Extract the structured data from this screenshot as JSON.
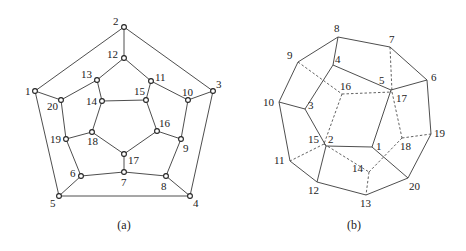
{
  "figures": [
    {
      "id": "a",
      "caption": "(a)",
      "caption_pos": [
        124,
        229
      ],
      "show_nodes": true,
      "nodes": {
        "1": {
          "x": 35,
          "y": 91,
          "lx": -10,
          "ly": 4
        },
        "2": {
          "x": 124,
          "y": 27,
          "lx": -11,
          "ly": -2
        },
        "3": {
          "x": 213,
          "y": 91,
          "lx": 3,
          "ly": -3
        },
        "4": {
          "x": 190,
          "y": 196,
          "lx": 3,
          "ly": 11
        },
        "5": {
          "x": 59,
          "y": 196,
          "lx": -9,
          "ly": 11
        },
        "6": {
          "x": 81,
          "y": 176,
          "lx": -11,
          "ly": 1
        },
        "7": {
          "x": 124,
          "y": 172,
          "lx": -3,
          "ly": 14
        },
        "8": {
          "x": 166,
          "y": 176,
          "lx": -5,
          "ly": 14
        },
        "9": {
          "x": 181,
          "y": 139,
          "lx": 2,
          "ly": 13
        },
        "10": {
          "x": 188,
          "y": 100,
          "lx": -6,
          "ly": -4
        },
        "11": {
          "x": 151,
          "y": 81,
          "lx": 4,
          "ly": 0
        },
        "12": {
          "x": 124,
          "y": 58,
          "lx": -17,
          "ly": 0
        },
        "13": {
          "x": 97,
          "y": 80,
          "lx": -16,
          "ly": -2
        },
        "14": {
          "x": 102,
          "y": 101,
          "lx": -16,
          "ly": 4
        },
        "15": {
          "x": 146,
          "y": 100,
          "lx": -12,
          "ly": -5
        },
        "16": {
          "x": 157,
          "y": 131,
          "lx": 2,
          "ly": -4
        },
        "17": {
          "x": 124,
          "y": 154,
          "lx": 4,
          "ly": 10
        },
        "18": {
          "x": 92,
          "y": 132,
          "lx": -5,
          "ly": 13
        },
        "19": {
          "x": 66,
          "y": 139,
          "lx": -16,
          "ly": 4
        },
        "20": {
          "x": 61,
          "y": 100,
          "lx": -14,
          "ly": 10
        }
      },
      "edges": [
        [
          "1",
          "2"
        ],
        [
          "2",
          "3"
        ],
        [
          "3",
          "4"
        ],
        [
          "4",
          "5"
        ],
        [
          "5",
          "1"
        ],
        [
          "2",
          "12"
        ],
        [
          "3",
          "10"
        ],
        [
          "4",
          "8"
        ],
        [
          "5",
          "6"
        ],
        [
          "1",
          "20"
        ],
        [
          "12",
          "13"
        ],
        [
          "12",
          "11"
        ],
        [
          "11",
          "10"
        ],
        [
          "10",
          "9"
        ],
        [
          "9",
          "8"
        ],
        [
          "8",
          "7"
        ],
        [
          "7",
          "6"
        ],
        [
          "6",
          "19"
        ],
        [
          "19",
          "20"
        ],
        [
          "20",
          "13"
        ],
        [
          "13",
          "14"
        ],
        [
          "11",
          "15"
        ],
        [
          "9",
          "16"
        ],
        [
          "7",
          "17"
        ],
        [
          "19",
          "18"
        ],
        [
          "14",
          "15"
        ],
        [
          "15",
          "16"
        ],
        [
          "16",
          "17"
        ],
        [
          "17",
          "18"
        ],
        [
          "18",
          "14"
        ]
      ],
      "dashed_edges": []
    },
    {
      "id": "b",
      "caption": "(b)",
      "caption_pos": [
        354,
        229
      ],
      "show_nodes": false,
      "nodes": {
        "1": {
          "x": 372,
          "y": 147,
          "lx": 4,
          "ly": 3
        },
        "2": {
          "x": 326,
          "y": 146,
          "lx": 2,
          "ly": -3
        },
        "3": {
          "x": 305,
          "y": 109,
          "lx": 3,
          "ly": 0
        },
        "4": {
          "x": 333,
          "y": 65,
          "lx": 2,
          "ly": -2
        },
        "5": {
          "x": 391,
          "y": 90,
          "lx": -12,
          "ly": -6
        },
        "6": {
          "x": 427,
          "y": 80,
          "lx": 4,
          "ly": 1
        },
        "7": {
          "x": 390,
          "y": 47,
          "lx": -1,
          "ly": -4
        },
        "8": {
          "x": 338,
          "y": 37,
          "lx": -4,
          "ly": -5
        },
        "9": {
          "x": 298,
          "y": 62,
          "lx": -11,
          "ly": -3
        },
        "10": {
          "x": 279,
          "y": 102,
          "lx": -16,
          "ly": 4
        },
        "11": {
          "x": 290,
          "y": 161,
          "lx": -16,
          "ly": 3
        },
        "12": {
          "x": 317,
          "y": 182,
          "lx": -9,
          "ly": 12
        },
        "13": {
          "x": 366,
          "y": 195,
          "lx": -6,
          "ly": 12
        },
        "14": {
          "x": 369,
          "y": 172,
          "lx": -17,
          "ly": 0
        },
        "15": {
          "x": 324,
          "y": 144,
          "lx": -16,
          "ly": -1
        },
        "16": {
          "x": 342,
          "y": 94,
          "lx": -2,
          "ly": -4
        },
        "17": {
          "x": 392,
          "y": 92,
          "lx": 4,
          "ly": 10
        },
        "18": {
          "x": 402,
          "y": 138,
          "lx": -2,
          "ly": 12
        },
        "19": {
          "x": 431,
          "y": 134,
          "lx": 3,
          "ly": 3
        },
        "20": {
          "x": 408,
          "y": 178,
          "lx": 1,
          "ly": 12
        }
      },
      "edges": [
        [
          "8",
          "7"
        ],
        [
          "7",
          "6"
        ],
        [
          "6",
          "19"
        ],
        [
          "19",
          "20"
        ],
        [
          "20",
          "13"
        ],
        [
          "13",
          "12"
        ],
        [
          "12",
          "11"
        ],
        [
          "11",
          "10"
        ],
        [
          "10",
          "9"
        ],
        [
          "9",
          "8"
        ],
        [
          "8",
          "4"
        ],
        [
          "4",
          "5"
        ],
        [
          "4",
          "3"
        ],
        [
          "3",
          "10"
        ],
        [
          "3",
          "2"
        ],
        [
          "2",
          "12"
        ],
        [
          "2",
          "1"
        ],
        [
          "1",
          "5"
        ],
        [
          "5",
          "6"
        ],
        [
          "1",
          "20"
        ]
      ],
      "dashed_edges": [
        [
          "7",
          "17"
        ],
        [
          "9",
          "16"
        ],
        [
          "16",
          "17"
        ],
        [
          "16",
          "15"
        ],
        [
          "15",
          "11"
        ],
        [
          "15",
          "14"
        ],
        [
          "14",
          "13"
        ],
        [
          "14",
          "18"
        ],
        [
          "17",
          "18"
        ],
        [
          "18",
          "19"
        ]
      ]
    }
  ]
}
